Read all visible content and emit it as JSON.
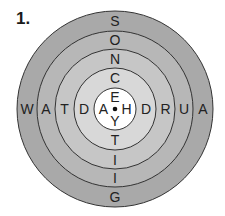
{
  "puzzle_number": "1.",
  "diagram": {
    "type": "concentric-letter-target",
    "center": [
      115,
      109
    ],
    "rings": [
      {
        "radius": 98,
        "fill": "#a9a9a9"
      },
      {
        "radius": 78,
        "fill": "#b7b7b7"
      },
      {
        "radius": 60,
        "fill": "#c6c6c6"
      },
      {
        "radius": 41,
        "fill": "#d8d8d8"
      },
      {
        "radius": 21,
        "fill": "#ffffff"
      }
    ],
    "vertical_top": [
      "S",
      "O",
      "N",
      "C",
      "E"
    ],
    "vertical_bottom": [
      "Y",
      "T",
      "I",
      "I",
      "G"
    ],
    "horizontal_left": [
      "W",
      "A",
      "T",
      "D",
      "A"
    ],
    "horizontal_right": [
      "H",
      "D",
      "R",
      "U",
      "A"
    ]
  }
}
